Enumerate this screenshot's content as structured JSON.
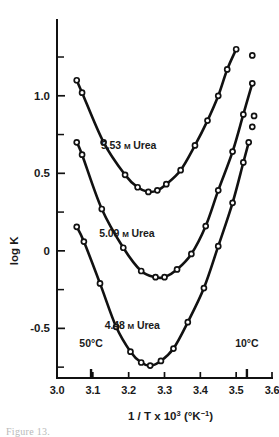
{
  "figure": {
    "caption": "Figure 13.",
    "background": "#ffffff",
    "ink_color": "#111111"
  },
  "chart_data": {
    "type": "line",
    "title": "",
    "subtitle": "",
    "xlabel": "1 / T x 10³ (°K⁻¹)",
    "xlabel_parts": {
      "base": "1 / T x 10",
      "exponent": "3",
      "units_open": " (°K",
      "units_exponent": "−1",
      "units_close": ")"
    },
    "ylabel": "log K",
    "xlim": [
      3.0,
      3.6
    ],
    "ylim": [
      -0.82,
      1.45
    ],
    "grid": false,
    "legend_position": "inline-labels",
    "xticks": [
      3.0,
      3.1,
      3.2,
      3.3,
      3.4,
      3.5,
      3.6
    ],
    "xtick_labels": [
      "3.0",
      "3.1",
      "3.2",
      "3.3",
      "3.4",
      "3.5",
      "3.6"
    ],
    "yticks_major": [
      1.0,
      0.5,
      0.0,
      -0.5
    ],
    "ytick_labels": [
      "1.0",
      "0.5",
      "0",
      "-0.5"
    ],
    "yticks_minor": [
      1.25,
      0.75,
      0.25,
      -0.25,
      -0.75
    ],
    "annotations": [
      {
        "text": "50°C",
        "x": 3.095,
        "y": -0.62,
        "marker_tick": true
      },
      {
        "text": "10°C",
        "x": 3.53,
        "y": -0.62,
        "marker_tick": true
      }
    ],
    "series": [
      {
        "name": "5.53 M Urea",
        "label": "5.53",
        "label_unit": "M",
        "label_tail": "Urea",
        "label_x": 3.2,
        "label_y": 0.66,
        "x": [
          3.055,
          3.07,
          3.13,
          3.19,
          3.225,
          3.255,
          3.28,
          3.305,
          3.345,
          3.385,
          3.42,
          3.45,
          3.475,
          3.5
        ],
        "y": [
          1.1,
          1.02,
          0.7,
          0.49,
          0.41,
          0.38,
          0.39,
          0.43,
          0.52,
          0.68,
          0.84,
          1.0,
          1.17,
          1.3
        ]
      },
      {
        "name": "5.09 M Urea",
        "label": "5.09",
        "label_unit": "M",
        "label_tail": "Urea",
        "label_x": 3.195,
        "label_y": 0.09,
        "x": [
          3.055,
          3.07,
          3.125,
          3.185,
          3.235,
          3.275,
          3.3,
          3.335,
          3.375,
          3.415,
          3.45,
          3.49,
          3.52,
          3.545
        ],
        "y": [
          0.7,
          0.62,
          0.27,
          0.02,
          -0.13,
          -0.17,
          -0.17,
          -0.12,
          -0.02,
          0.16,
          0.39,
          0.64,
          0.88,
          1.08
        ],
        "detached_points": [
          {
            "x": 3.545,
            "y": 1.26
          }
        ]
      },
      {
        "name": "4.48 M Urea",
        "label": "4.48",
        "label_unit": "M",
        "label_tail": "Urea",
        "label_x": 3.21,
        "label_y": -0.505,
        "x": [
          3.055,
          3.075,
          3.12,
          3.165,
          3.205,
          3.235,
          3.26,
          3.29,
          3.325,
          3.365,
          3.41,
          3.45,
          3.49,
          3.52,
          3.535
        ],
        "y": [
          0.155,
          0.06,
          -0.21,
          -0.49,
          -0.65,
          -0.72,
          -0.74,
          -0.71,
          -0.63,
          -0.46,
          -0.24,
          0.03,
          0.31,
          0.57,
          0.7
        ],
        "detached_points": [
          {
            "x": 3.545,
            "y": 0.8
          },
          {
            "x": 3.55,
            "y": 0.87
          }
        ]
      }
    ]
  }
}
